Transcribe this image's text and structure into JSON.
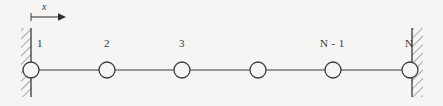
{
  "figure": {
    "type": "mechanics-diagram",
    "background_color": "#f6f5f3",
    "ink_color": "#3a3a3a"
  },
  "axis": {
    "label": "x",
    "label_x": 42,
    "label_y": 3,
    "origin_x": 31,
    "tick_top_y": 13,
    "tick_bottom_y": 21,
    "arrow_y": 17,
    "arrow_end_x": 64
  },
  "walls": [
    {
      "name": "left-wall",
      "x": 31,
      "y_top": 28,
      "y_bottom": 97,
      "hatch_side": "left"
    },
    {
      "name": "right-wall",
      "x": 412,
      "y_top": 28,
      "y_bottom": 97,
      "hatch_side": "right"
    }
  ],
  "chain": {
    "line_y": 70,
    "node_radius": 8,
    "nodes": [
      {
        "label": "1",
        "cx": 31,
        "label_x": 37,
        "label_y": 40
      },
      {
        "label": "2",
        "cx": 107,
        "label_x": 104,
        "label_y": 40
      },
      {
        "label": "3",
        "cx": 182,
        "label_x": 179,
        "label_y": 40
      },
      {
        "label": "",
        "cx": 258,
        "label_x": 255,
        "label_y": 40
      },
      {
        "label": "N - 1",
        "cx": 333,
        "label_x": 322,
        "label_y": 40
      },
      {
        "label": "N",
        "cx": 410,
        "label_x": 406,
        "label_y": 40
      }
    ]
  }
}
